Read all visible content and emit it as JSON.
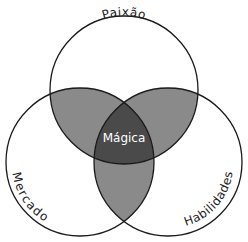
{
  "diagram": {
    "type": "venn",
    "sets": [
      {
        "id": "top",
        "label": "Paixão",
        "cx": 124,
        "cy": 90,
        "r": 74
      },
      {
        "id": "left",
        "label": "Mercado",
        "cx": 80,
        "cy": 162,
        "r": 74
      },
      {
        "id": "right",
        "label": "Habilidades",
        "cx": 168,
        "cy": 162,
        "r": 74
      }
    ],
    "center_label": "Mágica",
    "colors": {
      "background": "#ffffff",
      "stroke": "#1a1a1a",
      "pair_overlap": "#8a8a8a",
      "triple_overlap": "#4a4a4a",
      "center_text": "#ffffff",
      "label_text": "#222222"
    }
  }
}
